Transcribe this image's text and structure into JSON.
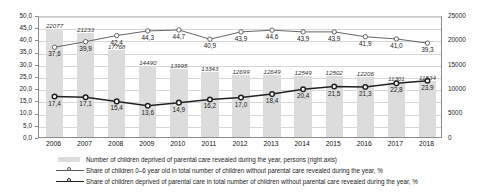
{
  "chart_data": {
    "type": "bar",
    "title": "",
    "subtitle": "",
    "xlabel": "",
    "ylabel": "",
    "grid": true,
    "legend_position": "bottom",
    "categories": [
      "2006",
      "2007",
      "2008",
      "2009",
      "2010",
      "2011",
      "2012",
      "2013",
      "2014",
      "2015",
      "2016",
      "2017",
      "2018"
    ],
    "left_axis": {
      "label": "%",
      "ylim": [
        0,
        50
      ],
      "ticks": [
        "0,0",
        "5,0",
        "10,0",
        "15,0",
        "20,0",
        "25,0",
        "30,0",
        "35,0",
        "40,0",
        "45,0",
        "50,0"
      ],
      "tick_values": [
        0,
        5,
        10,
        15,
        20,
        25,
        30,
        35,
        40,
        45,
        50
      ]
    },
    "right_axis": {
      "label": "persons",
      "ylim": [
        0,
        25000
      ],
      "ticks": [
        "0",
        "5000",
        "10000",
        "15000",
        "20000",
        "25000"
      ],
      "tick_values": [
        0,
        5000,
        10000,
        15000,
        20000,
        25000
      ]
    },
    "series": [
      {
        "name": "Number of children deprived of parental care revealed during the year, persons (right axis)",
        "type": "bar",
        "axis": "right",
        "color": "#dcdcdc",
        "values": [
          22077,
          21233,
          17768,
          14490,
          13995,
          13343,
          12699,
          12649,
          12549,
          12502,
          12206,
          11301,
          11534
        ],
        "labels": [
          "22077",
          "21233",
          "17768",
          "14490",
          "13995",
          "13343",
          "12699",
          "12649",
          "12549",
          "12502",
          "12206",
          "11301",
          "11534"
        ]
      },
      {
        "name": "Share of children 0–6 year old in total number of children without parental care revealed during the year, %",
        "type": "line",
        "axis": "left",
        "color": "#555555",
        "marker": "open-circle",
        "values": [
          37.6,
          39.9,
          42.4,
          44.3,
          44.7,
          40.9,
          43.9,
          44.6,
          43.9,
          43.9,
          41.9,
          41.0,
          39.3
        ],
        "labels": [
          "37,6",
          "39,9",
          "42,4",
          "44,3",
          "44,7",
          "40,9",
          "43,9",
          "44,6",
          "43,9",
          "43,9",
          "41,9",
          "41,0",
          "39,3"
        ]
      },
      {
        "name": "Share of children deprived of parental care in total number of children without parental care revealed during the year, %",
        "type": "line",
        "axis": "left",
        "color": "#222222",
        "marker": "open-circle-bold",
        "values": [
          17.4,
          17.1,
          15.4,
          13.6,
          14.9,
          16.2,
          17.0,
          18.4,
          20.4,
          21.5,
          21.3,
          22.8,
          23.9
        ],
        "labels": [
          "17,4",
          "17,1",
          "15,4",
          "13,6",
          "14,9",
          "16,2",
          "17,0",
          "18,4",
          "20,4",
          "21,5",
          "21,3",
          "22,8",
          "23,9"
        ]
      }
    ]
  },
  "legend": {
    "items": [
      {
        "label": "Number of children deprived of parental care revealed during the year, persons (right axis)",
        "marker": "bar-swatch"
      },
      {
        "label": "Share of children 0–6 year old in total number of children without parental care revealed during the year, %",
        "marker": "line-open-circle"
      },
      {
        "label": "Share of children deprived of parental care in total number of children without parental care revealed during the year, %",
        "marker": "line-open-circle-bold"
      }
    ]
  },
  "colors": {
    "bar": "#dcdcdc",
    "line_thin": "#555555",
    "line_thick": "#222222",
    "grid": "#d6d6d6",
    "axis": "#8a8a8a",
    "background": "#ffffff"
  }
}
